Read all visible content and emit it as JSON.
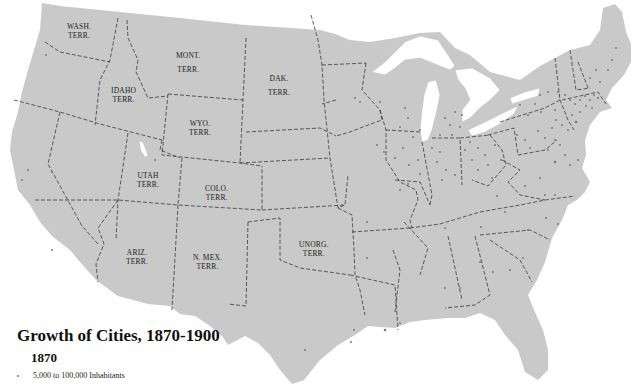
{
  "title": "Growth of Cities, 1870-1900",
  "subtitle": "1870",
  "legend": {
    "items": [
      {
        "symbol": "small-dot",
        "label": "5,000 to 100,000 Inhabitants"
      }
    ]
  },
  "colors": {
    "land": "#c9c9c9",
    "water": "#ffffff",
    "border": "#3a3a3a",
    "city_dot": "#7a7a7a",
    "text": "#111111"
  },
  "territories": [
    {
      "name": "WASH.",
      "suffix": "TERR."
    },
    {
      "name": "MONT.",
      "suffix": "TERR."
    },
    {
      "name": "DAK.",
      "suffix": "TERR."
    },
    {
      "name": "IDAHO",
      "suffix": "TERR."
    },
    {
      "name": "WYO.",
      "suffix": "TERR."
    },
    {
      "name": "UTAH",
      "suffix": "TERR."
    },
    {
      "name": "COLO.",
      "suffix": "TERR."
    },
    {
      "name": "ARIZ.",
      "suffix": "TERR."
    },
    {
      "name": "N. MEX.",
      "suffix": "TERR."
    },
    {
      "name": "UNORG.",
      "suffix": "TERR."
    }
  ]
}
